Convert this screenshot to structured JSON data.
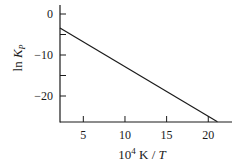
{
  "chart_data": {
    "type": "line",
    "title": "",
    "xlabel": "10^4 K / T",
    "xlabel_parts": {
      "base": "10",
      "exp": "4",
      "rest": " K / ",
      "var": "T"
    },
    "ylabel": "ln K_P",
    "ylabel_parts": {
      "fn": "ln ",
      "var": "K",
      "sub": "P"
    },
    "xlim": [
      2.2,
      23
    ],
    "ylim": [
      -26.5,
      2
    ],
    "x_ticks": [
      5,
      10,
      15,
      20
    ],
    "x_tick_labels": [
      "5",
      "10",
      "15",
      "20"
    ],
    "y_ticks": [
      0,
      -10,
      -20
    ],
    "y_tick_labels": [
      "0",
      "−10",
      "−20"
    ],
    "y_minor_ticks": [
      -5,
      -15
    ],
    "grid": false,
    "legend": null,
    "series": [
      {
        "name": "ln K_P vs 10^4 K/T",
        "x": [
          2.2,
          21.1
        ],
        "y": [
          -3.4,
          -26.3
        ],
        "color": "#1a1a1a"
      }
    ]
  }
}
